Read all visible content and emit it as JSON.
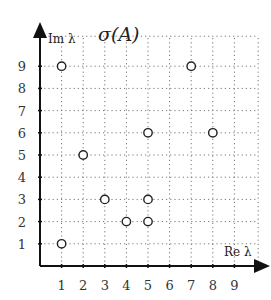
{
  "chart_data": {
    "type": "scatter",
    "title": "σ(A)",
    "xlabel": "Re λ",
    "ylabel": "Im λ",
    "x_ticks": [
      1,
      2,
      3,
      4,
      5,
      6,
      7,
      8,
      9
    ],
    "y_ticks": [
      1,
      2,
      3,
      4,
      5,
      6,
      7,
      8,
      9
    ],
    "xlim": [
      0,
      10
    ],
    "ylim": [
      0,
      10
    ],
    "grid": true,
    "grid_style": "dotted",
    "marker": "open-circle",
    "legend": null,
    "series": [
      {
        "name": "eigenvalues",
        "points": [
          {
            "x": 1,
            "y": 9
          },
          {
            "x": 7,
            "y": 9
          },
          {
            "x": 5,
            "y": 6
          },
          {
            "x": 8,
            "y": 6
          },
          {
            "x": 2,
            "y": 5
          },
          {
            "x": 3,
            "y": 3
          },
          {
            "x": 5,
            "y": 3
          },
          {
            "x": 4,
            "y": 2
          },
          {
            "x": 5,
            "y": 2
          },
          {
            "x": 1,
            "y": 1
          }
        ]
      }
    ]
  }
}
